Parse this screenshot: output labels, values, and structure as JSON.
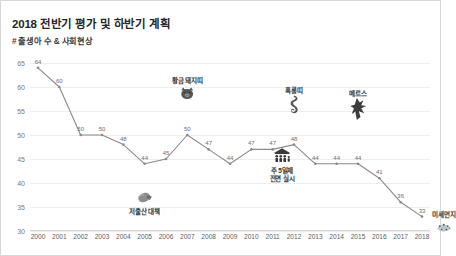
{
  "header": {
    "title": "2018 전반기 평가 및 하반기 계획",
    "subtitle": "# 출생아 수 & 사회현상"
  },
  "chart_data": {
    "type": "line",
    "title": "2018 전반기 평가 및 하반기 계획",
    "subtitle": "# 출생아 수 & 사회현상",
    "xlabel": "",
    "ylabel": "",
    "ylim": [
      30,
      65
    ],
    "yticks": [
      30,
      35,
      40,
      45,
      50,
      55,
      60,
      65
    ],
    "grid": true,
    "legend": "none",
    "line_color": "#808080",
    "categories": [
      "2000",
      "2001",
      "2002",
      "2003",
      "2004",
      "2005",
      "2006",
      "2007",
      "2008",
      "2009",
      "2010",
      "2011",
      "2012",
      "2013",
      "2014",
      "2015",
      "2016",
      "2017",
      "2018"
    ],
    "values": [
      64,
      60,
      50,
      50,
      48,
      44,
      45,
      50,
      47,
      44,
      47,
      47,
      48,
      44,
      44,
      44,
      41,
      36,
      33
    ],
    "point_labels": [
      "64",
      "60",
      "50",
      "50",
      "48",
      "44",
      "45",
      "50",
      "47",
      "44",
      "47",
      "47",
      "48",
      "44",
      "44",
      "44",
      "41",
      "36",
      "33"
    ],
    "annotations": [
      {
        "label": "저출산 대책",
        "icon": "hand-fist-icon",
        "x_category": "2005",
        "position": "below"
      },
      {
        "label": "황금 돼지띠",
        "icon": "pig-face-icon",
        "x_category": "2007",
        "position": "above"
      },
      {
        "label": "주 5일제\n전면 실시",
        "line1": "주 5일제",
        "line2": "전면 실시",
        "icon": "family-people-icon",
        "x_category": "2012",
        "position": "below"
      },
      {
        "label": "흑룡띠",
        "icon": "dragon-icon",
        "x_category": "2012",
        "position": "above"
      },
      {
        "label": "메르스",
        "icon": "virus-spike-icon",
        "x_category": "2015",
        "position": "above"
      },
      {
        "label": "미세먼지",
        "icon": "dust-cloud-icon",
        "x_category": "2018",
        "position": "right"
      }
    ]
  }
}
